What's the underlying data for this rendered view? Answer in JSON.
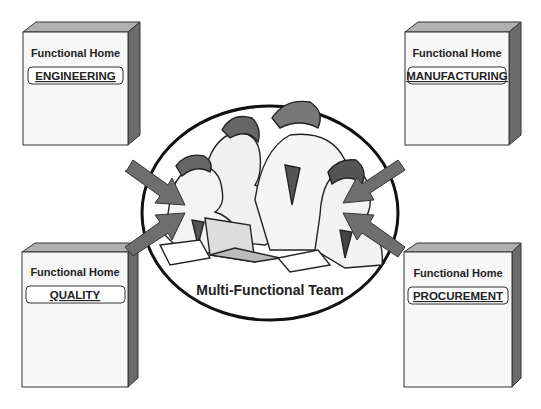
{
  "diagram": {
    "center": {
      "label": "Multi-Functional Team",
      "illustration": "team-of-people-at-laptop"
    },
    "boxes": [
      {
        "id": "engineering",
        "heading": "Functional Home",
        "department": "ENGINEERING",
        "position": "top-left"
      },
      {
        "id": "manufacturing",
        "heading": "Functional Home",
        "department": "MANUFACTURING",
        "position": "top-right"
      },
      {
        "id": "quality",
        "heading": "Functional Home",
        "department": "QUALITY",
        "position": "bottom-left"
      },
      {
        "id": "procurement",
        "heading": "Functional Home",
        "department": "PROCUREMENT",
        "position": "bottom-right"
      }
    ],
    "colors": {
      "box_face": "#f7f7f7",
      "box_side": "#6b6b6b",
      "box_top": "#b0b0b0",
      "arrow": "#6e6e6e",
      "ellipse_stroke": "#111111"
    }
  }
}
